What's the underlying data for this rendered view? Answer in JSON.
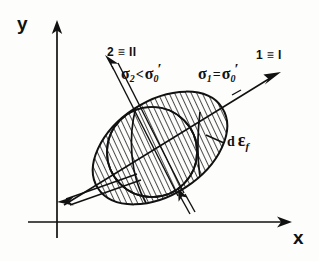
{
  "figure": {
    "kind": "stress-space-yield-surface-diagram",
    "background_color": "#fdfdfc",
    "ink_color": "#111111",
    "axes": {
      "x_label": "x",
      "y_label": "y",
      "origin": {
        "x": 57,
        "y": 222
      },
      "x_end": {
        "x": 288,
        "y": 222
      },
      "y_end": {
        "x": 57,
        "y": 22
      }
    },
    "principal_directions": [
      {
        "name": "direction-2",
        "label": "2 ≡ II",
        "stress_label_parts": {
          "symbol": "σ",
          "subscript": "2",
          "operator": "<",
          "rhs_symbol": "σ",
          "rhs_subscript": "0",
          "rhs_prime": "′"
        },
        "stress_label_text": "σ2 < σ0′",
        "arrow_tip": {
          "x": 105,
          "y": 57
        },
        "arrow_tail": {
          "x": 178,
          "y": 196
        },
        "double_line": true
      },
      {
        "name": "direction-1",
        "label": "1 ≡ I",
        "stress_label_parts": {
          "symbol": "σ",
          "subscript": "1",
          "operator": "=",
          "rhs_symbol": "σ",
          "rhs_subscript": "0",
          "rhs_prime": "′"
        },
        "stress_label_text": "σ1 = σ0′",
        "arrow_tip": {
          "x": 279,
          "y": 72
        },
        "arrow_tail": {
          "x": 64,
          "y": 205
        },
        "double_line": false
      }
    ],
    "annotations": [
      {
        "name": "strain-increment",
        "text_parts": {
          "d": "d",
          "epsilon": "ε",
          "subscript": "f"
        },
        "text": "d εf",
        "leader_from": {
          "x": 224,
          "y": 143
        },
        "leader_to": {
          "x": 206,
          "y": 136
        }
      }
    ],
    "ellipse": {
      "center": {
        "x": 160,
        "y": 148
      },
      "rx": 74,
      "ry": 47,
      "rotation_deg": -33,
      "hatched": true,
      "hatch_angle_deg": 8,
      "hatch_spacing_px": 5
    },
    "inner_circle": {
      "center": {
        "x": 152,
        "y": 152
      },
      "r": 45
    },
    "load_arrows": [
      {
        "name": "lower-left-double-arrow",
        "from": {
          "x": 135,
          "y": 178
        },
        "to": {
          "x": 62,
          "y": 204
        },
        "double_line": true
      },
      {
        "name": "lower-right-short-arrow",
        "from": {
          "x": 192,
          "y": 212
        },
        "to": {
          "x": 179,
          "y": 190
        },
        "double_line": true
      }
    ]
  }
}
